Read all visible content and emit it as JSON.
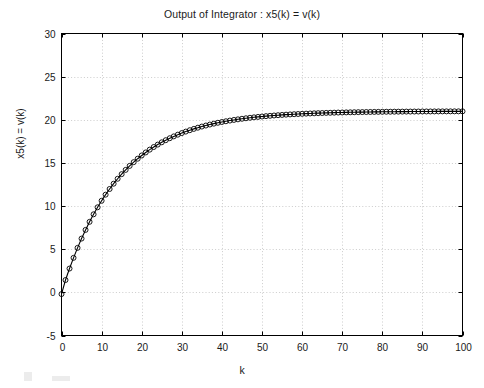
{
  "figure": {
    "title": "Output of Integrator : x5(k) = v(k)",
    "xlabel": "k",
    "ylabel": "x5(k) = v(k)",
    "background_color": "#ffffff",
    "axis_color": "#000000",
    "grid_color": "#bfbfbf",
    "line_color": "#000000",
    "marker": "circle-open"
  },
  "axes": {
    "x_ticks": [
      "0",
      "10",
      "20",
      "30",
      "40",
      "50",
      "60",
      "70",
      "80",
      "90",
      "100"
    ],
    "y_ticks": [
      "-5",
      "0",
      "5",
      "10",
      "15",
      "20",
      "25",
      "30"
    ]
  },
  "chart_data": {
    "type": "line",
    "title": "Output of Integrator : x5(k) = v(k)",
    "xlabel": "k",
    "ylabel": "x5(k) = v(k)",
    "xlim": [
      0,
      100
    ],
    "ylim": [
      -5,
      30
    ],
    "xticks": [
      0,
      10,
      20,
      30,
      40,
      50,
      60,
      70,
      80,
      90,
      100
    ],
    "yticks": [
      -5,
      0,
      5,
      10,
      15,
      20,
      25,
      30
    ],
    "grid": true,
    "legend": "none",
    "marker": "o",
    "markerfacecolor": "none",
    "linestyle": "-",
    "color": "#000000",
    "series": [
      {
        "name": "x5(k) = v(k)",
        "x": [
          0,
          1,
          2,
          3,
          4,
          5,
          6,
          7,
          8,
          9,
          10,
          11,
          12,
          13,
          14,
          15,
          16,
          17,
          18,
          19,
          20,
          21,
          22,
          23,
          24,
          25,
          26,
          27,
          28,
          29,
          30,
          31,
          32,
          33,
          34,
          35,
          36,
          37,
          38,
          39,
          40,
          41,
          42,
          43,
          44,
          45,
          46,
          47,
          48,
          49,
          50,
          51,
          52,
          53,
          54,
          55,
          56,
          57,
          58,
          59,
          60,
          61,
          62,
          63,
          64,
          65,
          66,
          67,
          68,
          69,
          70,
          71,
          72,
          73,
          74,
          75,
          76,
          77,
          78,
          79,
          80,
          81,
          82,
          83,
          84,
          85,
          86,
          87,
          88,
          89,
          90,
          91,
          92,
          93,
          94,
          95,
          96,
          97,
          98,
          99,
          100
        ],
        "y": [
          -0.2,
          0.53,
          1.24,
          1.93,
          2.6,
          3.25,
          3.87,
          4.47,
          5.05,
          5.61,
          6.15,
          6.67,
          7.17,
          7.66,
          8.12,
          8.57,
          9.0,
          9.42,
          9.82,
          10.2,
          10.57,
          10.93,
          11.27,
          11.6,
          11.92,
          12.23,
          12.52,
          12.8,
          13.08,
          13.34,
          13.59,
          13.83,
          14.06,
          14.28,
          14.5,
          14.7,
          14.9,
          15.09,
          15.27,
          15.45,
          15.61,
          15.78,
          15.93,
          16.08,
          16.22,
          16.36,
          16.49,
          16.62,
          16.74,
          16.85,
          16.96,
          17.07,
          17.17,
          17.27,
          17.36,
          17.45,
          17.54,
          17.62,
          17.7,
          17.78,
          17.85,
          17.92,
          17.99,
          18.05,
          18.11,
          18.17,
          18.23,
          18.28,
          18.33,
          18.38,
          18.43,
          18.47,
          18.52,
          18.56,
          18.6,
          18.64,
          18.68,
          18.71,
          18.75,
          18.78,
          18.81,
          18.84,
          18.87,
          18.9,
          18.92,
          18.95,
          18.97,
          19.0,
          19.02,
          19.04,
          19.06,
          19.08,
          19.1,
          19.12,
          19.14,
          19.16,
          19.17,
          19.19,
          19.2,
          19.22,
          19.23
        ],
        "asymptote": 21.0,
        "description": "Saturating exponential rise from 0 toward steady-state value of approximately 21"
      }
    ]
  }
}
